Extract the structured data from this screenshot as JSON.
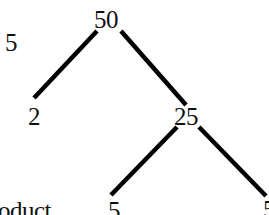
{
  "diagram": {
    "type": "factor-tree",
    "colors": {
      "line": "#000000",
      "text": "#111111",
      "background": "#ffffff"
    },
    "side_label": "5",
    "bottom_label": "oduct",
    "nodes": {
      "root": "50",
      "left_child": "2",
      "right_child": "25",
      "right_left_leaf": "5",
      "right_right_leaf": "5"
    },
    "edges": [
      {
        "from": "50",
        "to": "2"
      },
      {
        "from": "50",
        "to": "25"
      },
      {
        "from": "25",
        "to": "5"
      },
      {
        "from": "25",
        "to": "5"
      }
    ]
  }
}
